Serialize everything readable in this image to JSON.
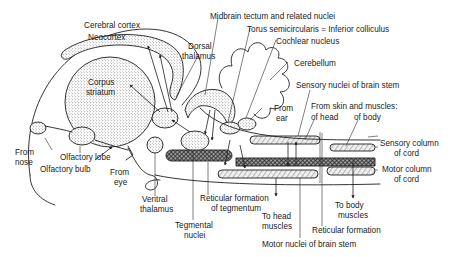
{
  "diagram": {
    "title": "",
    "type": "anatomical-schematic",
    "colors": {
      "ink": "#1e1e1e",
      "background": "#ffffff"
    },
    "labels": {
      "cerebral_cortex": "Cerebral cortex",
      "neocortex": "Neocortex",
      "corpus_striatum_1": "Corpus",
      "corpus_striatum_2": "striatum",
      "dorsal_thalamus_1": "Dorsal",
      "dorsal_thalamus_2": "thalamus",
      "midbrain_tectum": "Midbrain tectum and related nuclei",
      "torus": "Torus semicircularis = Inferior colliculus",
      "cochlear_nucleus": "Cochlear nucleus",
      "cerebellum": "Cerebellum",
      "sensory_nuclei": "Sensory nuclei of brain stem",
      "from_ear_1": "From",
      "from_ear_2": "ear",
      "from_skin": "From skin and muscles:",
      "of_head": "of head",
      "of_body": "of body",
      "sensory_column_1": "Sensory column",
      "sensory_column_2": "of cord",
      "motor_column_1": "Motor column",
      "motor_column_2": "of cord",
      "from_nose_1": "From",
      "from_nose_2": "nose",
      "olfactory_lobe": "Olfactory lobe",
      "olfactory_bulb": "Olfactory bulb",
      "from_eye_1": "From",
      "from_eye_2": "eye",
      "ventral_thalamus_1": "Ventral",
      "ventral_thalamus_2": "thalamus",
      "tegmental_nuclei_1": "Tegmental",
      "tegmental_nuclei_2": "nuclei",
      "reticular_tegmentum_1": "Reticular formation",
      "reticular_tegmentum_2": "of tegmentum",
      "to_head_muscles_1": "To head",
      "to_head_muscles_2": "muscles",
      "to_body_muscles_1": "To body",
      "to_body_muscles_2": "muscles",
      "reticular_formation": "Reticular formation",
      "motor_nuclei": "Motor nuclei of brain stem"
    }
  }
}
